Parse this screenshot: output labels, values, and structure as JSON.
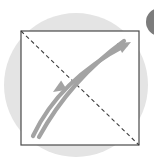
{
  "figure": {
    "title": "Lorenz curve diagram",
    "caption": "",
    "background_color": "#ffffff"
  },
  "backdrop_circle": {
    "name": "backdrop-circle",
    "fill": "#e4e4e4",
    "cx": 76,
    "cy": 85,
    "r": 72
  },
  "accent_circle": {
    "name": "accent-circle-clipped",
    "fill": "#7c7c7c",
    "cx": 160,
    "cy": 22,
    "r": 14
  },
  "plot_frame": {
    "name": "plot-frame-square",
    "stroke": "#4a4a4a",
    "fill": "#ffffff",
    "stroke_width": 1.2,
    "x": 21,
    "y": 31,
    "width": 118,
    "height": 114
  },
  "diagonal": {
    "name": "equality-diagonal-dashed",
    "stroke": "#3d3d3d",
    "stroke_width": 1.1,
    "dash": "4 3",
    "x1": 21,
    "y1": 31,
    "x2": 139,
    "y2": 145
  },
  "curves": [
    {
      "name": "outer-curve-arrow-up-right",
      "stroke": "#a3a3a3",
      "stroke_width": 4.2,
      "direction": "up-right",
      "path": "M 33 136 C 48 104, 74 72, 126 45"
    },
    {
      "name": "inner-curve-arrow-down-left",
      "stroke": "#a3a3a3",
      "stroke_width": 4.2,
      "direction": "down-left",
      "path": "M 39 137 C 56 106, 84 70, 124 41"
    }
  ],
  "arrowheads": [
    {
      "name": "arrowhead-up-right",
      "fill": "#a3a3a3",
      "tip_x": 131,
      "tip_y": 42,
      "angle_deg": -28
    },
    {
      "name": "arrowhead-down-left",
      "fill": "#a3a3a3",
      "tip_x": 53,
      "tip_y": 92,
      "angle_deg": 148
    }
  ],
  "colors": {
    "backdrop_gray": "#e4e4e4",
    "accent_dark_gray": "#7c7c7c",
    "curve_gray": "#a3a3a3",
    "frame_stroke": "#4a4a4a",
    "dash_stroke": "#3d3d3d",
    "plot_fill": "#ffffff"
  },
  "chart_data": {
    "type": "line",
    "title": "Lorenz curve diagram",
    "xlabel": "",
    "ylabel": "",
    "xlim": [
      0,
      1
    ],
    "ylim": [
      0,
      1
    ],
    "grid": false,
    "legend": "none",
    "annotations": [
      "dashed line of equality",
      "arrow up-right",
      "arrow down-left"
    ],
    "series": [
      {
        "name": "line-of-equality",
        "style": "dashed",
        "x": [
          0,
          1
        ],
        "y": [
          1,
          0
        ]
      },
      {
        "name": "outer-curve",
        "style": "solid",
        "x": [
          0.1,
          0.23,
          0.45,
          0.68,
          0.89
        ],
        "y": [
          0.08,
          0.3,
          0.54,
          0.72,
          0.91
        ]
      },
      {
        "name": "inner-curve",
        "style": "solid",
        "x": [
          0.15,
          0.3,
          0.53,
          0.74,
          0.87
        ],
        "y": [
          0.07,
          0.33,
          0.6,
          0.8,
          0.94
        ]
      }
    ]
  }
}
